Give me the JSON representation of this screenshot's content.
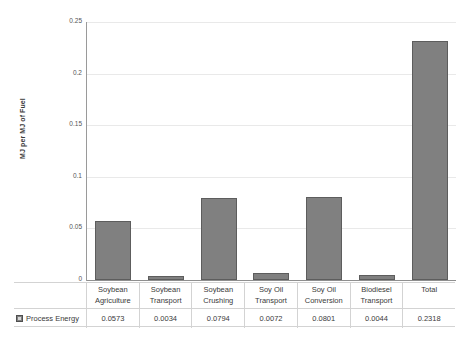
{
  "chart_data": {
    "type": "bar",
    "title": "",
    "xlabel": "",
    "ylabel": "MJ per MJ of Fuel",
    "ylim": [
      0,
      0.25
    ],
    "grid": true,
    "legend_position": "table-left",
    "series_name": "Process Energy",
    "bar_color": "#808080",
    "bar_border_color": "#5d5d5d",
    "categories": [
      "Soybean Agriculture",
      "Soybean Transport",
      "Soybean Crushing",
      "Soy Oil Transport",
      "Soy Oil Conversion",
      "Biodiesel Transport",
      "Total"
    ],
    "category_lines": [
      [
        "Soybean",
        "Agriculture"
      ],
      [
        "Soybean",
        "Transport"
      ],
      [
        "Soybean",
        "Crushing"
      ],
      [
        "Soy Oil",
        "Transport"
      ],
      [
        "Soy Oil",
        "Conversion"
      ],
      [
        "Biodiesel",
        "Transport"
      ],
      [
        "Total",
        ""
      ]
    ],
    "values": [
      0.0573,
      0.0034,
      0.0794,
      0.0072,
      0.0801,
      0.0044,
      0.2318
    ],
    "value_labels": [
      "0.0573",
      "0.0034",
      "0.0794",
      "0.0072",
      "0.0801",
      "0.0044",
      "0.2318"
    ],
    "yticks": [
      0.25,
      0.2,
      0.15,
      0.1,
      0.05,
      0
    ],
    "ytick_labels": [
      "0.25",
      "0.2",
      "0.15",
      "0.1",
      "0.05",
      "0"
    ]
  },
  "legend": {
    "swatch_icon": "legend-swatch-icon",
    "label": "Process Energy"
  }
}
